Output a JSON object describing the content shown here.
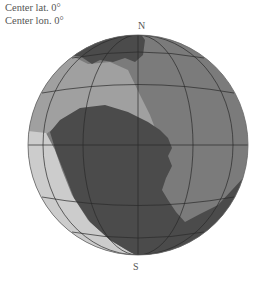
{
  "info": {
    "center_lat": "Center lat. 0°",
    "center_lon": "Center lon. 0°"
  },
  "labels": {
    "north": "N",
    "south": "S"
  },
  "globe": {
    "projection": "orthographic",
    "center_lat": 0,
    "center_lon": 0,
    "graticule_step_deg": 30,
    "colors": {
      "dark_region": "#4b4b4b",
      "medium_region": "#7b7b7b",
      "light_medium_region": "#a0a0a0",
      "light_region": "#cccccc",
      "grid_lines": "#2a2a2a"
    }
  }
}
